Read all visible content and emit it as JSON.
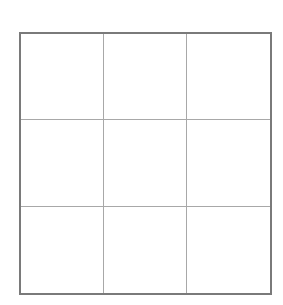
{
  "diagram": {
    "type": "grid",
    "rows": 3,
    "columns": 3,
    "cells": [
      [
        "",
        "",
        ""
      ],
      [
        "",
        "",
        ""
      ],
      [
        "",
        "",
        ""
      ]
    ],
    "colors": {
      "background": "#ffffff",
      "outer_border": "#7a7a7a",
      "inner_lines": "#a8a8a8"
    }
  }
}
